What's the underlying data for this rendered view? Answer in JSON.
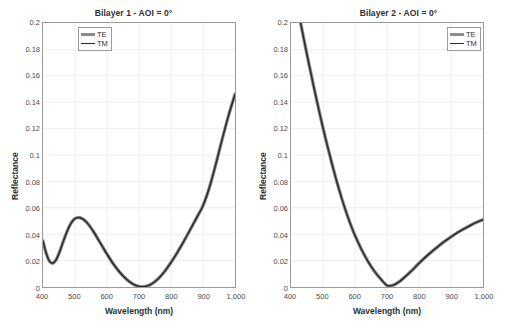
{
  "figure": {
    "width": 510,
    "height": 330,
    "background": "#ffffff",
    "axis_color": "#9a9a9a",
    "grid_color": "#ededed",
    "te_color": "#8c8c8c",
    "tm_color": "#2b2b2b"
  },
  "panels": [
    {
      "id": "bilayer-1",
      "title": "Bilayer 1 - AOI = 0°",
      "legend": {
        "position": "top-left",
        "entries": [
          {
            "label": "TE",
            "style": "thick-grey"
          },
          {
            "label": "TM",
            "style": "thin-black"
          }
        ]
      }
    },
    {
      "id": "bilayer-2",
      "title": "Bilayer 2 - AOI = 0°",
      "legend": {
        "position": "top-right",
        "entries": [
          {
            "label": "TE",
            "style": "thick-grey"
          },
          {
            "label": "TM",
            "style": "thin-black"
          }
        ]
      }
    }
  ],
  "axes": {
    "xlabel": "Wavelength (nm)",
    "ylabel": "Reflectance",
    "xticks": [
      "400",
      "500",
      "600",
      "700",
      "800",
      "900",
      "1,000"
    ],
    "xtick_values": [
      400,
      500,
      600,
      700,
      800,
      900,
      1000
    ],
    "yticks": [
      "0",
      "0.02",
      "0.04",
      "0.06",
      "0.08",
      "0.1",
      "0.12",
      "0.14",
      "0.16",
      "0.18",
      "0.2"
    ],
    "ytick_values": [
      0,
      0.02,
      0.04,
      0.06,
      0.08,
      0.1,
      0.12,
      0.14,
      0.16,
      0.18,
      0.2
    ],
    "xlim": [
      400,
      1000
    ],
    "ylim": [
      0,
      0.2
    ],
    "grid": true
  },
  "chart_data": [
    {
      "type": "line",
      "title": "Bilayer 1 - AOI = 0°",
      "xlabel": "Wavelength (nm)",
      "ylabel": "Reflectance",
      "xlim": [
        400,
        1000
      ],
      "ylim": [
        0,
        0.2
      ],
      "grid": true,
      "legend": [
        "TE",
        "TM"
      ],
      "legend_position": "upper left",
      "x": [
        400,
        410,
        420,
        430,
        440,
        450,
        460,
        470,
        480,
        490,
        500,
        510,
        520,
        530,
        540,
        550,
        560,
        570,
        580,
        590,
        600,
        620,
        640,
        660,
        680,
        700,
        720,
        740,
        760,
        780,
        800,
        820,
        840,
        860,
        880,
        900,
        920,
        940,
        960,
        980,
        1000
      ],
      "series": [
        {
          "name": "TE",
          "values": [
            0.0348,
            0.0255,
            0.0196,
            0.018,
            0.0202,
            0.0255,
            0.0322,
            0.0389,
            0.0448,
            0.0492,
            0.0518,
            0.0526,
            0.0521,
            0.0505,
            0.048,
            0.0448,
            0.0411,
            0.0371,
            0.033,
            0.0289,
            0.0249,
            0.0174,
            0.0111,
            0.0061,
            0.0024,
            0.0004,
            0.0004,
            0.0024,
            0.0063,
            0.0118,
            0.0186,
            0.0263,
            0.0346,
            0.0434,
            0.0524,
            0.0616,
            0.0754,
            0.093,
            0.112,
            0.13,
            0.146
          ]
        },
        {
          "name": "TM",
          "values": [
            0.0348,
            0.0255,
            0.0196,
            0.018,
            0.0202,
            0.0255,
            0.0322,
            0.0389,
            0.0448,
            0.0492,
            0.0518,
            0.0526,
            0.0521,
            0.0505,
            0.048,
            0.0448,
            0.0411,
            0.0371,
            0.033,
            0.0289,
            0.0249,
            0.0174,
            0.0111,
            0.0061,
            0.0024,
            0.0004,
            0.0004,
            0.0024,
            0.0063,
            0.0118,
            0.0186,
            0.0263,
            0.0346,
            0.0434,
            0.0524,
            0.0616,
            0.0754,
            0.093,
            0.112,
            0.13,
            0.146
          ]
        }
      ],
      "notes": "TE and TM overlap exactly at normal incidence (AOI = 0°)."
    },
    {
      "type": "line",
      "title": "Bilayer 2 - AOI = 0°",
      "xlabel": "Wavelength (nm)",
      "ylabel": "Reflectance",
      "xlim": [
        400,
        1000
      ],
      "ylim": [
        0,
        0.2
      ],
      "grid": true,
      "legend": [
        "TE",
        "TM"
      ],
      "legend_position": "upper right",
      "x": [
        430,
        440,
        450,
        460,
        470,
        480,
        490,
        500,
        510,
        520,
        530,
        540,
        550,
        560,
        570,
        580,
        590,
        600,
        620,
        640,
        660,
        680,
        700,
        720,
        740,
        760,
        780,
        800,
        820,
        840,
        860,
        880,
        900,
        920,
        940,
        960,
        980,
        1000
      ],
      "series": [
        {
          "name": "TE",
          "values": [
            0.2,
            0.188,
            0.176,
            0.1645,
            0.153,
            0.142,
            0.131,
            0.1205,
            0.1105,
            0.101,
            0.0915,
            0.0825,
            0.074,
            0.066,
            0.0585,
            0.0515,
            0.045,
            0.039,
            0.0286,
            0.0196,
            0.0122,
            0.0062,
            0.0012,
            0.0014,
            0.0043,
            0.0085,
            0.0131,
            0.018,
            0.0226,
            0.0268,
            0.0308,
            0.0345,
            0.038,
            0.0412,
            0.044,
            0.0466,
            0.049,
            0.051
          ]
        },
        {
          "name": "TM",
          "values": [
            0.2,
            0.188,
            0.176,
            0.1645,
            0.153,
            0.142,
            0.131,
            0.1205,
            0.1105,
            0.101,
            0.0915,
            0.0825,
            0.074,
            0.066,
            0.0585,
            0.0515,
            0.045,
            0.039,
            0.0286,
            0.0196,
            0.0122,
            0.0062,
            0.0012,
            0.0014,
            0.0043,
            0.0085,
            0.0131,
            0.018,
            0.0226,
            0.0268,
            0.0308,
            0.0345,
            0.038,
            0.0412,
            0.044,
            0.0466,
            0.049,
            0.051
          ]
        }
      ],
      "notes": "Curve is clipped at the top of the axes; it exceeds 0.2 below about 430 nm. TE and TM overlap exactly at normal incidence (AOI = 0°)."
    }
  ]
}
